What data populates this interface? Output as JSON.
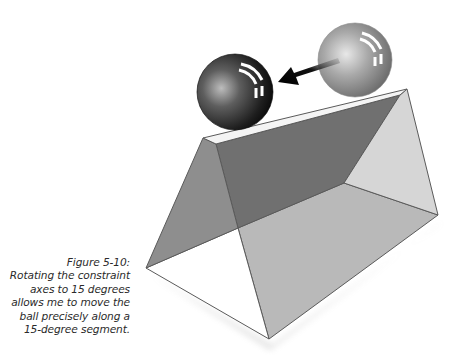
{
  "figure": {
    "label": "Figure 5-10:",
    "caption_lines": [
      "Rotating the constraint",
      "axes to 15 degrees",
      "allows me to move the",
      "ball precisely along a",
      "15-degree segment."
    ]
  },
  "illustration": {
    "objects": [
      {
        "name": "start-ball",
        "shade": "light-gray"
      },
      {
        "name": "end-ball",
        "shade": "dark-gray"
      },
      {
        "name": "move-arrow",
        "direction": "left-down"
      },
      {
        "name": "trapezoid-prism",
        "shade": "gray"
      }
    ],
    "colors": {
      "left_face": "#8e8e8e",
      "back_face": "#707070",
      "right_face": "#d6d6d6",
      "floor": "#b9b9b9",
      "edge": "#5a5a5a",
      "top_slab": "#f4f4f4"
    }
  }
}
